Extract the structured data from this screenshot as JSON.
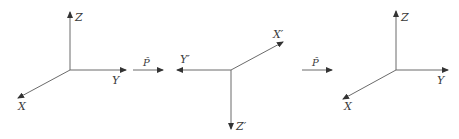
{
  "diagram": {
    "frames": [
      {
        "name": "original",
        "axes": {
          "z": "Z",
          "y": "Y",
          "x": "X"
        }
      },
      {
        "name": "inverted",
        "axes": {
          "x": "X′",
          "y": "Y′",
          "z": "Z′"
        }
      },
      {
        "name": "rotated-back",
        "axes": {
          "z": "Z",
          "y": "Y",
          "x": "X"
        }
      }
    ],
    "operators": [
      {
        "label": "P̂"
      },
      {
        "label": "P̂"
      }
    ],
    "colors": {
      "line": "#6b6b6b",
      "text": "#3a3a3a"
    }
  }
}
